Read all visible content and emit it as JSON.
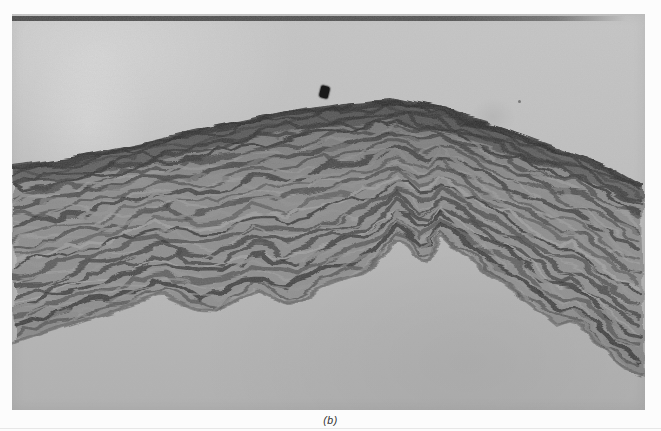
{
  "figure": {
    "caption": "(b)",
    "kind": "grayscale photomicrograph",
    "subject": "wavy fibrous tissue band (histology cross-section)"
  },
  "colors": {
    "page_margin": "#fcfcfc",
    "photo_background": "#c0c0c0",
    "tissue_dark": "#343434",
    "tissue_mid": "#8f8f8f",
    "tissue_light": "#b9b9b9",
    "debris_speck": "#181818"
  }
}
